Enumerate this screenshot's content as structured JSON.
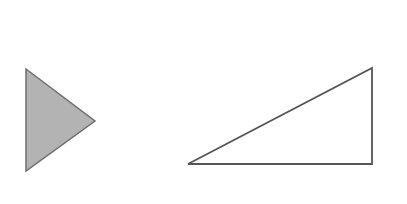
{
  "diagram": {
    "width": 407,
    "height": 204,
    "background": "#ffffff",
    "shapes": [
      {
        "id": "filled-triangle",
        "type": "triangle",
        "points": [
          [
            26,
            69
          ],
          [
            95,
            121
          ],
          [
            26,
            171
          ]
        ],
        "fill": "#b3b3b3",
        "stroke": "#6e6e6e",
        "stroke_width": 1.5
      },
      {
        "id": "right-triangle",
        "type": "triangle",
        "points": [
          [
            188,
            164
          ],
          [
            372,
            68
          ],
          [
            372,
            164
          ]
        ],
        "fill": "#ffffff",
        "stroke": "#555555",
        "stroke_width": 1.8
      }
    ]
  }
}
